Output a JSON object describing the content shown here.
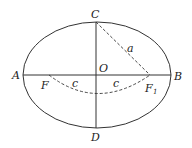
{
  "diagram": {
    "points": {
      "A": "A",
      "B": "B",
      "C": "C",
      "D": "D",
      "O": "O",
      "F": "F",
      "F1": "F",
      "F1_sub": "1"
    },
    "segments": {
      "a": "a",
      "c_left": "c",
      "c_right": "c"
    },
    "colors": {
      "stroke": "#333333",
      "background": "#ffffff"
    }
  }
}
